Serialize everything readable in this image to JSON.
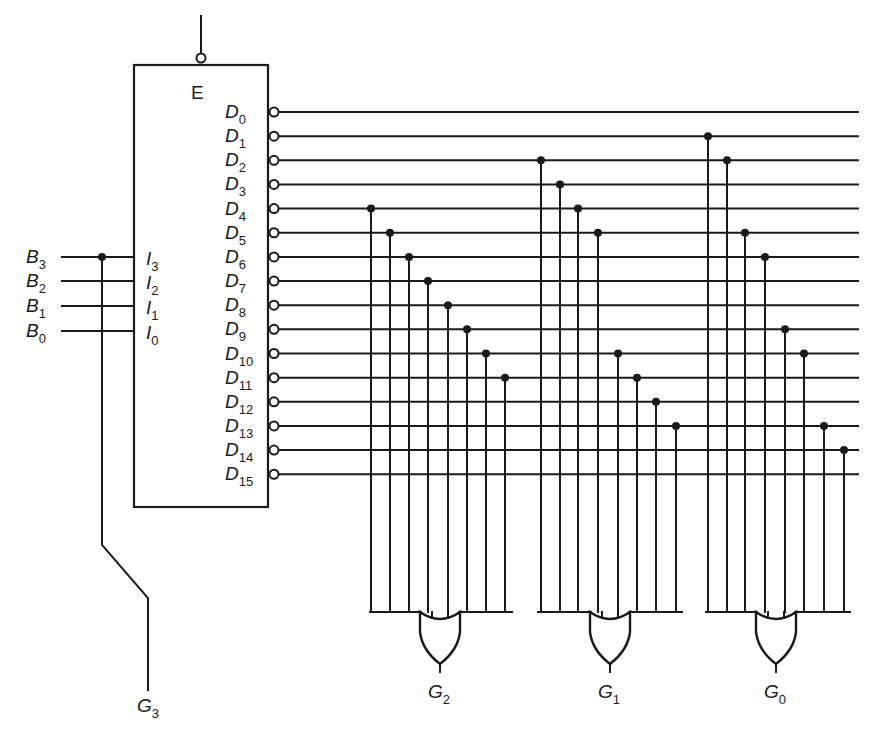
{
  "figure": {
    "decoder": {
      "enable_label": "E",
      "enable_active_low": true,
      "inputs": [
        {
          "name": "I",
          "sub": "3",
          "source": "B",
          "source_sub": "3"
        },
        {
          "name": "I",
          "sub": "2",
          "source": "B",
          "source_sub": "2"
        },
        {
          "name": "I",
          "sub": "1",
          "source": "B",
          "source_sub": "1"
        },
        {
          "name": "I",
          "sub": "0",
          "source": "B",
          "source_sub": "0"
        }
      ],
      "outputs": [
        {
          "name": "D",
          "sub": "0"
        },
        {
          "name": "D",
          "sub": "1"
        },
        {
          "name": "D",
          "sub": "2"
        },
        {
          "name": "D",
          "sub": "3"
        },
        {
          "name": "D",
          "sub": "4"
        },
        {
          "name": "D",
          "sub": "5"
        },
        {
          "name": "D",
          "sub": "6"
        },
        {
          "name": "D",
          "sub": "7"
        },
        {
          "name": "D",
          "sub": "8"
        },
        {
          "name": "D",
          "sub": "9"
        },
        {
          "name": "D",
          "sub": "10"
        },
        {
          "name": "D",
          "sub": "11"
        },
        {
          "name": "D",
          "sub": "12"
        },
        {
          "name": "D",
          "sub": "13"
        },
        {
          "name": "D",
          "sub": "14"
        },
        {
          "name": "D",
          "sub": "15"
        }
      ]
    },
    "outputs": [
      {
        "name": "G",
        "sub": "3",
        "source": "B3 (direct wire)"
      },
      {
        "name": "G",
        "sub": "2",
        "gate": "OR",
        "taps": [
          4,
          5,
          6,
          7,
          8,
          9,
          10,
          11
        ]
      },
      {
        "name": "G",
        "sub": "1",
        "gate": "OR",
        "taps": [
          2,
          3,
          4,
          5,
          10,
          11,
          12,
          13
        ]
      },
      {
        "name": "G",
        "sub": "0",
        "gate": "OR",
        "taps": [
          1,
          2,
          5,
          6,
          9,
          10,
          13,
          14
        ]
      }
    ],
    "colors": {
      "ink": "#1a1a1a",
      "background": "#ffffff"
    }
  }
}
